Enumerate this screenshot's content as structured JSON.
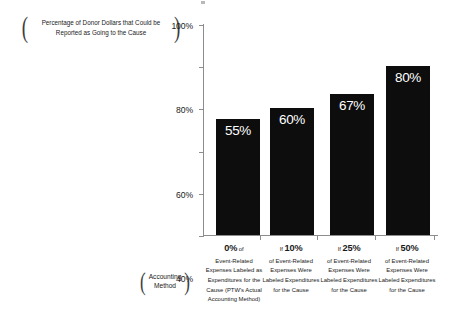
{
  "chart_data": {
    "type": "bar",
    "title": "",
    "xlabel": "Accounting Method",
    "ylabel": "Percentage of Donor Dollars that Could be Reported as Going to the Cause",
    "categories": [
      "0% of Event-Related Expenses Labeled as Expenditures for the Cause (PTW's Actual Accounting Method)",
      "If 10% of Event-Related Expenses Were Labeled Expenditures for the Cause",
      "If 25% of Event-Related Expenses Were Labeled Expenditures for the Cause",
      "If 50% of Event-Related Expenses Were Labeled Expenditures for the Cause"
    ],
    "values": [
      55,
      60,
      67,
      80
    ],
    "value_labels": [
      "55%",
      "60%",
      "67%",
      "80%"
    ],
    "ylim": [
      0,
      100
    ],
    "yticks": [
      0,
      20,
      40,
      60,
      80,
      100
    ],
    "ytick_labels": [
      "0%",
      "20%",
      "40%",
      "60%",
      "80%",
      "100%"
    ],
    "grid": false,
    "legend": false,
    "bar_color": "#0d0d0d",
    "value_label_color": "#ffffff",
    "background_color": "#ffffff",
    "axis_color": "#8d8d8d"
  },
  "axis_caption_y": {
    "open_paren": "(",
    "text": "Percentage of Donor Dollars that Could be Reported as Going to the Cause",
    "close_paren": ")"
  },
  "axis_caption_x": {
    "open_paren": "(",
    "line1": "Accounting",
    "line2": "Method",
    "close_paren": ")"
  },
  "categories_detail": [
    {
      "prefix": "",
      "pct": "0%",
      "suffix": "of",
      "body": "Event-Related Expenses Labeled as Expenditures for the Cause (PTW's Actual Accounting Method)"
    },
    {
      "prefix": "If",
      "pct": "10%",
      "suffix": "",
      "body": "of Event-Related Expenses Were Labeled Expenditures for the Cause"
    },
    {
      "prefix": "If",
      "pct": "25%",
      "suffix": "",
      "body": "of Event-Related Expenses Were Labeled Expenditures for the Cause"
    },
    {
      "prefix": "If",
      "pct": "50%",
      "suffix": "",
      "body": "of Event-Related Expenses Were Labeled Expenditures for the Cause"
    }
  ]
}
